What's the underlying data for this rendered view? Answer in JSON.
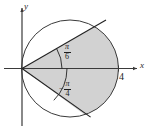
{
  "figure": {
    "kind": "polar-sector-diagram",
    "background_color": "#ffffff",
    "stroke_color": "#1d1d1d",
    "shade_color": "#d2d2d2",
    "axes": {
      "x_label": "x",
      "y_label": "y"
    },
    "ticks": [
      {
        "axis": "x",
        "label": "4",
        "value": 4
      }
    ],
    "angles": [
      {
        "id": "upper-angle",
        "sign": "",
        "numerator": "π",
        "denominator": "6",
        "value_radians": 0.5235987756,
        "degrees": 30
      },
      {
        "id": "lower-angle",
        "sign": "−",
        "numerator": "π",
        "denominator": "4",
        "value_radians": -0.7853981634,
        "degrees": -45
      }
    ],
    "circle": {
      "description": "circle through origin with rightmost point at x = 4",
      "diameter_value": 4,
      "center_px": [
        70,
        68.5
      ],
      "radius_px": 48.5
    },
    "origin_px": [
      22,
      68.5
    ],
    "shaded_region": "sector bounded by rays at pi/6 and -pi/4 and the circle arc"
  }
}
